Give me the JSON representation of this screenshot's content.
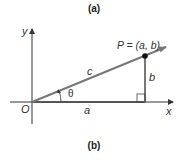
{
  "captions": {
    "top": "(a)",
    "bottom": "(b)"
  },
  "labels": {
    "origin": "O",
    "x_axis": "x",
    "y_axis": "y",
    "point": "P = (a, b)",
    "hypotenuse": "c",
    "adjacent": "a",
    "opposite": "b",
    "angle": "θ"
  },
  "colors": {
    "axis": "#333333",
    "segment": "#777777",
    "point": "#111111"
  }
}
